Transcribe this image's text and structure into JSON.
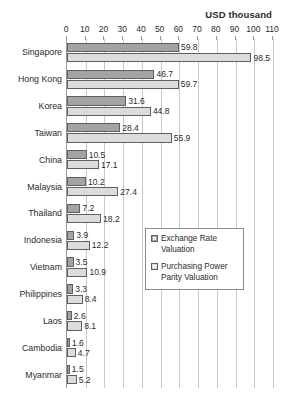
{
  "chart_data": {
    "type": "bar",
    "orientation": "horizontal",
    "title": "",
    "xlabel": "USD thousand",
    "ylabel": "",
    "xlim": [
      0,
      110
    ],
    "xticks": [
      0,
      10,
      20,
      30,
      40,
      50,
      60,
      70,
      80,
      90,
      100,
      110
    ],
    "grid": true,
    "legend_position": "center-right-inside",
    "categories": [
      "Singapore",
      "Hong Kong",
      "Korea",
      "Taiwan",
      "China",
      "Malaysia",
      "Thailand",
      "Indonesia",
      "Vietnam",
      "Philippines",
      "Laos",
      "Cambodia",
      "Myanmar"
    ],
    "series": [
      {
        "name": "Exchange Rate Valuation",
        "color": "#a3a3a3",
        "values": [
          59.8,
          46.7,
          31.6,
          28.4,
          10.5,
          10.2,
          7.2,
          3.9,
          3.5,
          3.3,
          2.6,
          1.6,
          1.5
        ]
      },
      {
        "name": "Purchasing Power Parity Valuation",
        "color": "#dcdcdc",
        "values": [
          98.5,
          59.7,
          44.8,
          55.9,
          17.1,
          27.4,
          18.2,
          12.2,
          10.9,
          8.4,
          8.1,
          4.7,
          5.2
        ]
      }
    ]
  },
  "legend": {
    "items": [
      {
        "label": "Exchange Rate Valuation"
      },
      {
        "label": "Purchasing Power Parity Valuation"
      }
    ]
  },
  "axis": {
    "unit_title": "USD thousand"
  }
}
